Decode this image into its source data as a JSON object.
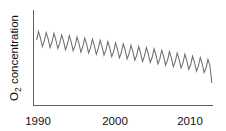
{
  "chart_data": {
    "type": "line",
    "title": "",
    "subtitle": "",
    "xlabel": "",
    "ylabel": "O2 concentration",
    "ylabel_parts": {
      "pre": "O",
      "sub": "2",
      "post": " concentration"
    },
    "xlim": [
      1989.6,
      2012.9
    ],
    "ylim": [
      0,
      100
    ],
    "xticks": [
      1990,
      2000,
      2010
    ],
    "xtick_labels": [
      "1990",
      "2000",
      "2010"
    ],
    "yticks": [],
    "ytick_labels": [],
    "grid": false,
    "legend": null,
    "legend_position": "none",
    "axes": {
      "left_spine": true,
      "bottom_spine": true,
      "top_spine": false,
      "right_spine": false,
      "tick_marks": false
    },
    "annotations": [],
    "series": [
      {
        "name": "O2 concentration",
        "color": "#6e6e6e",
        "description": "Seasonal sawtooth oscillation superimposed on a steady long-term decline",
        "trend": {
          "type": "linear-decline",
          "start_value": 74,
          "end_value": 16,
          "seasonal_amplitude_start": 9.5,
          "seasonal_amplitude_end": 8.5,
          "cycles_per_year": 1
        },
        "x": [
          1990.0,
          1990.25,
          1990.5,
          1990.75,
          1991.0,
          1991.25,
          1991.5,
          1991.75,
          1992.0,
          1992.25,
          1992.5,
          1992.75,
          1993.0,
          1993.25,
          1993.5,
          1993.75,
          1994.0,
          1994.25,
          1994.5,
          1994.75,
          1995.0,
          1995.25,
          1995.5,
          1995.75,
          1996.0,
          1996.25,
          1996.5,
          1996.75,
          1997.0,
          1997.25,
          1997.5,
          1997.75,
          1998.0,
          1998.25,
          1998.5,
          1998.75,
          1999.0,
          1999.25,
          1999.5,
          1999.75,
          2000.0,
          2000.25,
          2000.5,
          2000.75,
          2001.0,
          2001.25,
          2001.5,
          2001.75,
          2002.0,
          2002.25,
          2002.5,
          2002.75,
          2003.0,
          2003.25,
          2003.5,
          2003.75,
          2004.0,
          2004.25,
          2004.5,
          2004.75,
          2005.0,
          2005.25,
          2005.5,
          2005.75,
          2006.0,
          2006.25,
          2006.5,
          2006.75,
          2007.0,
          2007.25,
          2007.5,
          2007.75,
          2008.0,
          2008.25,
          2008.5,
          2008.75,
          2009.0,
          2009.25,
          2009.5,
          2009.75,
          2010.0,
          2010.25,
          2010.5,
          2010.75,
          2011.0,
          2011.25,
          2011.5,
          2011.75,
          2012.0,
          2012.25,
          2012.5,
          2012.75
        ],
        "values": [
          69.0,
          78.5,
          71.5,
          62.0,
          68.0,
          77.5,
          70.5,
          61.0,
          67.0,
          76.5,
          69.5,
          60.0,
          65.5,
          75.0,
          68.0,
          58.5,
          64.5,
          74.0,
          67.0,
          57.5,
          63.0,
          72.5,
          65.5,
          56.0,
          62.0,
          71.5,
          64.5,
          55.0,
          60.5,
          70.0,
          63.0,
          53.5,
          59.5,
          69.0,
          62.0,
          52.5,
          58.0,
          67.5,
          60.5,
          51.0,
          56.5,
          66.0,
          59.0,
          49.5,
          55.5,
          65.0,
          58.0,
          48.5,
          54.0,
          63.5,
          56.5,
          47.0,
          52.5,
          62.0,
          55.0,
          45.5,
          51.5,
          61.0,
          54.0,
          44.5,
          50.0,
          59.5,
          52.5,
          43.0,
          48.5,
          58.0,
          51.0,
          41.5,
          47.0,
          56.5,
          49.5,
          40.0,
          45.5,
          55.0,
          48.0,
          38.5,
          44.0,
          53.5,
          46.5,
          37.0,
          42.0,
          51.5,
          44.5,
          35.0,
          40.5,
          50.0,
          43.0,
          33.5,
          38.5,
          48.0,
          41.0,
          22.0
        ]
      }
    ]
  },
  "colors": {
    "line": "#6e6e6e",
    "axis": "#5f5f5f",
    "text": "#111111",
    "background": "#ffffff"
  }
}
